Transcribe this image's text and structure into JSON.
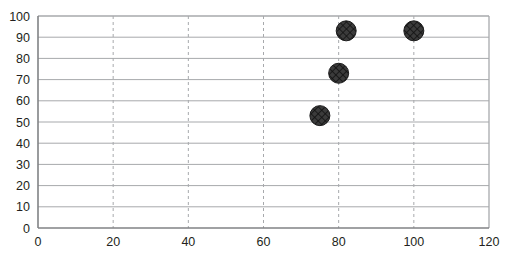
{
  "chart_data": {
    "type": "scatter",
    "title": "",
    "subtitle": "",
    "xlabel": "",
    "ylabel": "",
    "xlim": [
      0,
      120
    ],
    "ylim": [
      0,
      100
    ],
    "x_ticks": [
      0,
      20,
      40,
      60,
      80,
      100,
      120
    ],
    "y_ticks": [
      0,
      10,
      20,
      30,
      40,
      50,
      60,
      70,
      80,
      90,
      100
    ],
    "x_tick_labels": [
      "0",
      "20",
      "40",
      "60",
      "80",
      "100",
      "120"
    ],
    "y_tick_labels": [
      "0",
      "10",
      "20",
      "30",
      "40",
      "50",
      "60",
      "70",
      "80",
      "90",
      "100"
    ],
    "grid": {
      "horizontal": true,
      "horizontal_style": "solid",
      "vertical": true,
      "vertical_style": "dashed",
      "color": "#a7a9ac"
    },
    "legend": {
      "visible": false,
      "position": "none",
      "entries": []
    },
    "series": [
      {
        "name": "Series 1",
        "marker": "circle-crosshatch",
        "marker_color": "#3b3b3b",
        "marker_size": 20,
        "points": [
          {
            "x": 75,
            "y": 53
          },
          {
            "x": 80,
            "y": 73
          },
          {
            "x": 82,
            "y": 93
          },
          {
            "x": 100,
            "y": 93
          }
        ]
      }
    ],
    "annotations": []
  },
  "colors": {
    "background": "#ffffff",
    "axis": "#808285",
    "grid": "#a7a9ac",
    "text": "#231f20",
    "marker": "#3b3b3b",
    "marker_hatch": "#1a1a1a"
  }
}
